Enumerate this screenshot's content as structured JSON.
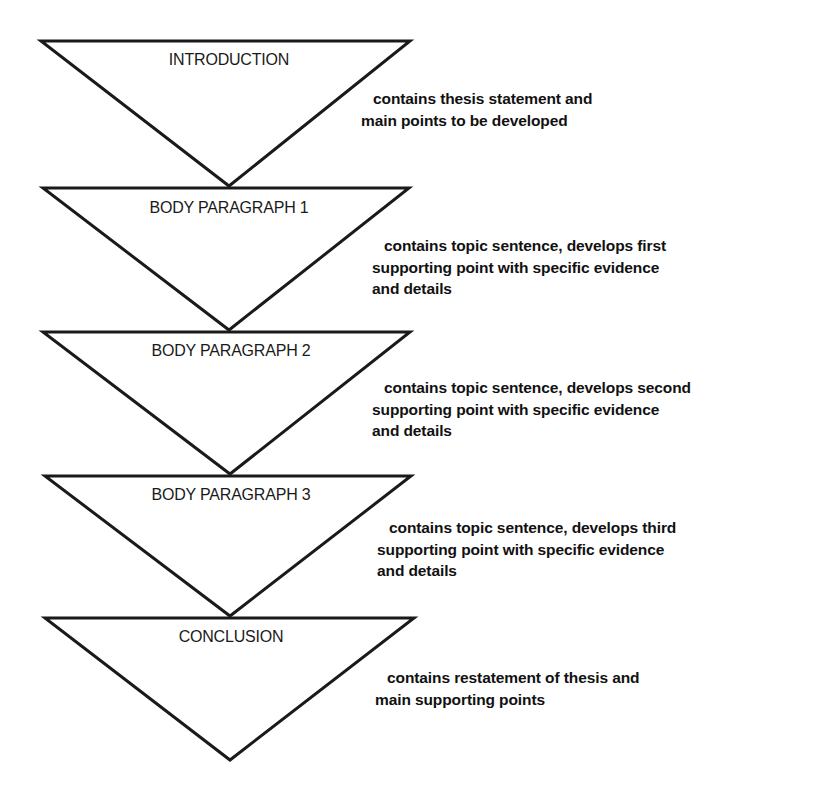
{
  "diagram": {
    "type": "inverted-triangle essay structure",
    "stroke_color": "#1a1a1a",
    "sections": [
      {
        "label": "INTRODUCTION",
        "description_lines": [
          "contains thesis statement and",
          "main points to be developed"
        ]
      },
      {
        "label": "BODY PARAGRAPH 1",
        "description_lines": [
          "contains topic sentence, develops first",
          "supporting point with specific evidence",
          "and details"
        ]
      },
      {
        "label": "BODY PARAGRAPH 2",
        "description_lines": [
          "contains topic sentence, develops second",
          "supporting point with specific evidence",
          "and details"
        ]
      },
      {
        "label": "BODY PARAGRAPH 3",
        "description_lines": [
          "contains topic sentence, develops third",
          "supporting point with specific evidence",
          "and details"
        ]
      },
      {
        "label": "CONCLUSION",
        "description_lines": [
          "contains restatement of thesis and",
          "main supporting points"
        ]
      }
    ]
  }
}
